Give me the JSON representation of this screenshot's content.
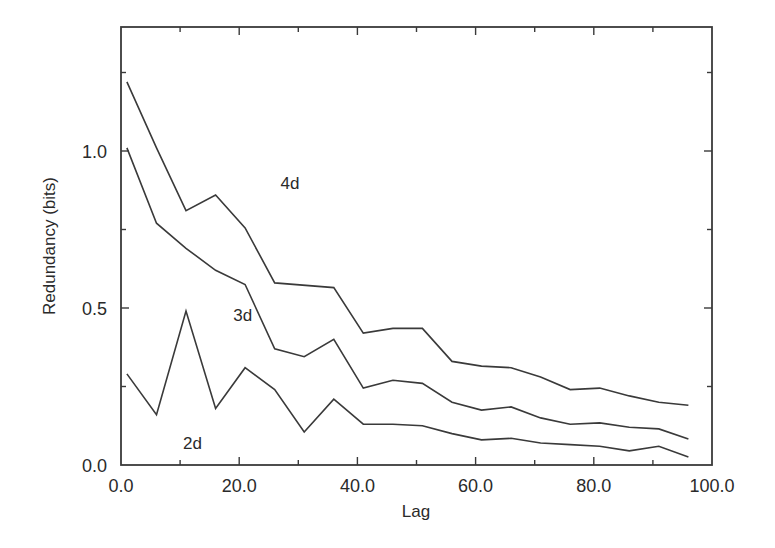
{
  "chart_data": {
    "type": "line",
    "title": "",
    "xlabel": "Lag",
    "ylabel": "Redundancy (bits)",
    "xlim": [
      0,
      100
    ],
    "ylim": [
      0,
      1.4
    ],
    "x_ticks": [
      0,
      20,
      40,
      60,
      80,
      100
    ],
    "x_tick_labels": [
      "0.0",
      "20.0",
      "40.0",
      "60.0",
      "80.0",
      "100.0"
    ],
    "y_ticks": [
      0,
      0.5,
      1.0
    ],
    "y_tick_labels": [
      "0.0",
      "0.5",
      "1.0"
    ],
    "grid": false,
    "legend": "inline labels",
    "series": [
      {
        "name": "4d",
        "label_pos": [
          27,
          0.88
        ],
        "x": [
          1,
          6,
          11,
          16,
          21,
          26,
          36,
          41,
          46,
          51,
          56,
          61,
          66,
          71,
          76,
          81,
          86,
          91,
          96
        ],
        "values": [
          1.22,
          1.01,
          0.81,
          0.86,
          0.755,
          0.58,
          0.565,
          0.42,
          0.435,
          0.435,
          0.33,
          0.315,
          0.31,
          0.28,
          0.24,
          0.245,
          0.22,
          0.2,
          0.19
        ]
      },
      {
        "name": "3d",
        "label_pos": [
          19,
          0.46
        ],
        "x": [
          1,
          6,
          11,
          16,
          21,
          26,
          31,
          36,
          41,
          46,
          51,
          56,
          61,
          66,
          71,
          76,
          81,
          86,
          91,
          96
        ],
        "values": [
          1.01,
          0.77,
          0.69,
          0.62,
          0.575,
          0.37,
          0.345,
          0.4,
          0.245,
          0.27,
          0.26,
          0.2,
          0.175,
          0.185,
          0.15,
          0.13,
          0.134,
          0.12,
          0.115,
          0.083
        ]
      },
      {
        "name": "2d",
        "label_pos": [
          10.5,
          0.05
        ],
        "x": [
          1,
          6,
          11,
          16,
          21,
          26,
          31,
          36,
          41,
          46,
          51,
          56,
          61,
          66,
          71,
          76,
          81,
          86,
          91,
          96
        ],
        "values": [
          0.29,
          0.16,
          0.49,
          0.18,
          0.31,
          0.24,
          0.105,
          0.21,
          0.13,
          0.13,
          0.125,
          0.1,
          0.08,
          0.085,
          0.07,
          0.065,
          0.06,
          0.045,
          0.06,
          0.025
        ]
      }
    ]
  }
}
